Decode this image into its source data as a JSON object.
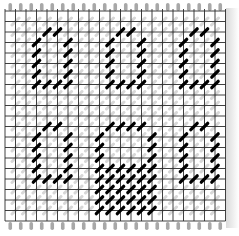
{
  "canvas": {
    "width": 239,
    "height": 236,
    "background": "#ffffff"
  },
  "grid": {
    "origin_x": 5,
    "origin_y": 11,
    "cell": 10.5,
    "columns": 21,
    "rows": 20,
    "line_color": "#2a2a2a",
    "faint_stitch_color": "#b8b8b8",
    "tick_color": "#a8a8a8"
  },
  "stitch": {
    "color": "#000000",
    "length": 9,
    "width": 3.2
  },
  "digits": [
    {
      "name": "digit-top-left",
      "stitches": [
        [
          4,
          2
        ],
        [
          5,
          2
        ],
        [
          3,
          3
        ],
        [
          3,
          4
        ],
        [
          3,
          5
        ],
        [
          3,
          6
        ],
        [
          6,
          3
        ],
        [
          6,
          4
        ],
        [
          6,
          5
        ],
        [
          6,
          6
        ],
        [
          3,
          7
        ],
        [
          4,
          7
        ],
        [
          5,
          7
        ],
        [
          6,
          7
        ]
      ]
    },
    {
      "name": "digit-top-middle",
      "stitches": [
        [
          11,
          2
        ],
        [
          12,
          2
        ],
        [
          10,
          3
        ],
        [
          10,
          4
        ],
        [
          10,
          5
        ],
        [
          10,
          6
        ],
        [
          13,
          3
        ],
        [
          13,
          4
        ],
        [
          13,
          5
        ],
        [
          13,
          6
        ],
        [
          10,
          7
        ],
        [
          11,
          7
        ],
        [
          12,
          7
        ],
        [
          13,
          7
        ]
      ]
    },
    {
      "name": "digit-top-right",
      "stitches": [
        [
          18,
          2
        ],
        [
          19,
          2
        ],
        [
          17,
          3
        ],
        [
          17,
          4
        ],
        [
          17,
          5
        ],
        [
          17,
          6
        ],
        [
          20,
          3
        ],
        [
          20,
          4
        ],
        [
          20,
          5
        ],
        [
          20,
          6
        ],
        [
          17,
          7
        ],
        [
          18,
          7
        ],
        [
          19,
          7
        ],
        [
          20,
          7
        ]
      ]
    },
    {
      "name": "digit-bottom-left",
      "stitches": [
        [
          4,
          11
        ],
        [
          5,
          11
        ],
        [
          3,
          12
        ],
        [
          3,
          13
        ],
        [
          3,
          14
        ],
        [
          3,
          15
        ],
        [
          6,
          12
        ],
        [
          6,
          13
        ],
        [
          6,
          14
        ],
        [
          6,
          15
        ],
        [
          3,
          16
        ],
        [
          4,
          16
        ],
        [
          5,
          16
        ],
        [
          6,
          16
        ]
      ]
    },
    {
      "name": "digit-bottom-middle",
      "stitches": [
        [
          10,
          11
        ],
        [
          11,
          11
        ],
        [
          12,
          11
        ],
        [
          13,
          11
        ],
        [
          9,
          12
        ],
        [
          9,
          13
        ],
        [
          9,
          14
        ],
        [
          14,
          12
        ],
        [
          14,
          13
        ],
        [
          14,
          14
        ],
        [
          9,
          15
        ],
        [
          10,
          15
        ],
        [
          11,
          15
        ],
        [
          12,
          15
        ],
        [
          13,
          15
        ],
        [
          14,
          15
        ],
        [
          9,
          16
        ],
        [
          10,
          16
        ],
        [
          11,
          16
        ],
        [
          12,
          16
        ],
        [
          13,
          16
        ],
        [
          14,
          16
        ],
        [
          9,
          17
        ],
        [
          10,
          17
        ],
        [
          11,
          17
        ],
        [
          12,
          17
        ],
        [
          13,
          17
        ],
        [
          14,
          17
        ],
        [
          9,
          18
        ],
        [
          10,
          18
        ],
        [
          11,
          18
        ],
        [
          12,
          18
        ],
        [
          13,
          18
        ],
        [
          14,
          18
        ],
        [
          9,
          19
        ],
        [
          10,
          19
        ],
        [
          11,
          19
        ],
        [
          12,
          19
        ],
        [
          13,
          19
        ],
        [
          14,
          19
        ]
      ]
    },
    {
      "name": "digit-bottom-right",
      "stitches": [
        [
          18,
          11
        ],
        [
          19,
          11
        ],
        [
          17,
          12
        ],
        [
          17,
          13
        ],
        [
          17,
          14
        ],
        [
          17,
          15
        ],
        [
          20,
          12
        ],
        [
          20,
          13
        ],
        [
          20,
          14
        ],
        [
          20,
          15
        ],
        [
          17,
          16
        ],
        [
          18,
          16
        ],
        [
          19,
          16
        ],
        [
          20,
          16
        ]
      ]
    }
  ]
}
